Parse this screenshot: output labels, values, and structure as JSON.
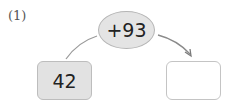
{
  "problem": {
    "number_label": "(1)",
    "operation": "+93",
    "start_value": "42",
    "answer_value": ""
  },
  "colors": {
    "oval_fill": "#e4e4e4",
    "start_box_fill": "#e2e2e2",
    "answer_box_fill": "#ffffff",
    "border": "#b5b5b5",
    "line": "#8a8a8a"
  },
  "icons": [
    "arrow-right-curved"
  ]
}
